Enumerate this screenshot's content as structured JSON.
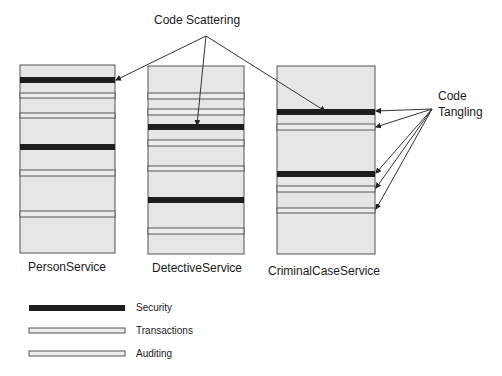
{
  "annotations": {
    "scattering_label": "Code Scattering",
    "tangling_label_line1": "Code",
    "tangling_label_line2": "Tangling"
  },
  "colors": {
    "module_fill": "#e6e6e6",
    "module_border": "#555555",
    "security": "#1e1e1e",
    "transactions": "#e9e9e9",
    "auditing": "#e9e9e9",
    "connector": "#333333"
  },
  "modules": [
    {
      "name": "PersonService",
      "x": 20,
      "y": 65,
      "w": 95,
      "h": 188,
      "security_bars": [
        77,
        144
      ],
      "transaction_lines": [
        [
          93,
          98
        ],
        [
          113,
          118
        ]
      ],
      "auditing_lines": [
        [
          170,
          176
        ],
        [
          211,
          217
        ]
      ]
    },
    {
      "name": "DetectiveService",
      "x": 148,
      "y": 66,
      "w": 96,
      "h": 188,
      "security_bars": [
        124,
        197
      ],
      "transaction_lines": [
        [
          93,
          99
        ],
        [
          109,
          115
        ],
        [
          140,
          146
        ]
      ],
      "auditing_lines": [
        [
          166,
          171
        ],
        [
          228,
          234
        ]
      ]
    },
    {
      "name": "CriminalCaseService",
      "x": 277,
      "y": 66,
      "w": 98,
      "h": 188,
      "security_bars": [
        109,
        171
      ],
      "transaction_lines": [
        [
          124,
          130
        ],
        [
          186,
          192
        ]
      ],
      "auditing_lines": [
        [
          208,
          213
        ]
      ]
    }
  ],
  "legend": [
    {
      "label": "Security",
      "kind": "security"
    },
    {
      "label": "Transactions",
      "kind": "transactions"
    },
    {
      "label": "Auditing",
      "kind": "auditing"
    }
  ]
}
